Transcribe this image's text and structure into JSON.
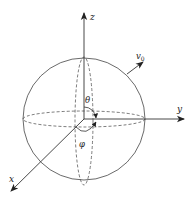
{
  "diagram": {
    "type": "spherical-coordinates",
    "colors": {
      "stroke": "#333333",
      "background": "#ffffff"
    },
    "axes": {
      "z": {
        "label": "z"
      },
      "y": {
        "label": "y"
      },
      "x": {
        "label": "x"
      }
    },
    "vector": {
      "label": "v",
      "subscript": "0"
    },
    "angles": {
      "polar": {
        "label": "θ"
      },
      "azimuth": {
        "label": "φ"
      }
    }
  }
}
